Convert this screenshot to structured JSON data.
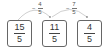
{
  "boxes": [
    {
      "numerator": "15",
      "denominator": "5"
    },
    {
      "numerator": "11",
      "denominator": "5"
    },
    {
      "numerator": "4",
      "denominator": "5"
    }
  ],
  "operations": [
    {
      "sign": "−",
      "numerator": "4",
      "denominator": "5"
    },
    {
      "sign": "−",
      "numerator": "7",
      "denominator": "5"
    }
  ],
  "colors": {
    "border": "#666666",
    "arc": "#cccccc",
    "text": "#333333"
  }
}
